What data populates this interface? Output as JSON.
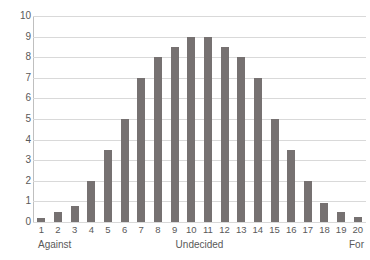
{
  "chart_data": {
    "type": "bar",
    "title": "",
    "xlabel": "",
    "ylabel": "",
    "grid": true,
    "legend": false,
    "ylim": [
      0,
      10
    ],
    "ytick_labels": [
      "10",
      "9",
      "8",
      "7",
      "6",
      "5",
      "4",
      "3",
      "2",
      "1",
      "0"
    ],
    "ytick_values": [
      10,
      9,
      8,
      7,
      6,
      5,
      4,
      3,
      2,
      1,
      0
    ],
    "categories": [
      "1",
      "2",
      "3",
      "4",
      "5",
      "6",
      "7",
      "8",
      "9",
      "10",
      "11",
      "12",
      "13",
      "14",
      "15",
      "16",
      "17",
      "18",
      "19",
      "20"
    ],
    "values": [
      0.2,
      0.5,
      0.8,
      2,
      3.5,
      5,
      7,
      8,
      8.5,
      9,
      9,
      8.5,
      8,
      7,
      5,
      3.5,
      2,
      0.9,
      0.5,
      0.25
    ],
    "axis_captions": {
      "left": "Against",
      "center": "Undecided",
      "right": "For"
    },
    "colors": {
      "bar": "#767171",
      "gridline": "#d9d9d9",
      "axis": "#bfbfbf",
      "text": "#595959",
      "background": "#ffffff"
    }
  }
}
